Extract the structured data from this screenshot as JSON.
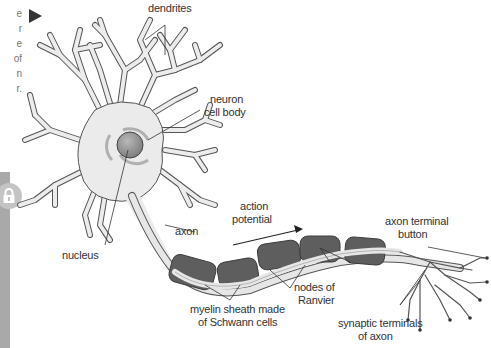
{
  "side_panel": {
    "text_lines": [
      "e",
      "r",
      "e",
      "of",
      "n",
      "r."
    ],
    "play_button": "play-icon",
    "lock_button": "lock-icon"
  },
  "diagram": {
    "labels": {
      "dendrites": "dendrites",
      "cell_body_1": "neuron",
      "cell_body_2": "cell body",
      "nucleus": "nucleus",
      "axon": "axon",
      "action_potential_1": "action",
      "action_potential_2": "potential",
      "nodes_1": "nodes of",
      "nodes_2": "Ranvier",
      "myelin_1": "myelin sheath made",
      "myelin_2": "of Schwann cells",
      "terminal_button_1": "axon terminal",
      "terminal_button_2": "button",
      "synaptic_1": "synaptic terminals",
      "synaptic_2": "of axon"
    },
    "colors": {
      "cell_fill": "#ebebeb",
      "outline": "#555555",
      "nucleus": "#8a8a8a",
      "myelin": "#5e5e5e",
      "axon_fill": "#e6e6e6",
      "side_bar": "#a9a9a9"
    }
  }
}
